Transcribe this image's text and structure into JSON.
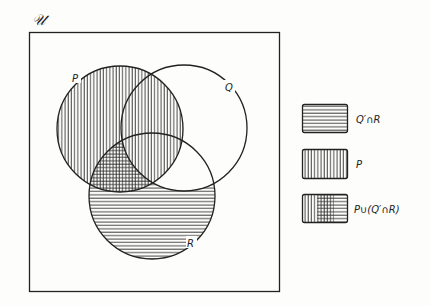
{
  "diagram": {
    "universe_label": "𝒰",
    "sets": [
      {
        "name": "P",
        "label": "P",
        "cx": 120,
        "cy": 129,
        "r": 63
      },
      {
        "name": "Q",
        "label": "Q",
        "cx": 184,
        "cy": 128,
        "r": 63
      },
      {
        "name": "R",
        "label": "R",
        "cx": 152,
        "cy": 196,
        "r": 63
      }
    ],
    "shading": {
      "P": "vertical lines",
      "Q_prime_and_R": "horizontal lines",
      "overlap": "cross-hatch"
    },
    "legend": [
      {
        "pattern": "horizontal",
        "label": "Q′∩R"
      },
      {
        "pattern": "vertical",
        "label": "P"
      },
      {
        "pattern": "combined",
        "label": "P∪(Q′∩R)"
      }
    ],
    "colors": {
      "ink": "#222222",
      "background": "#fdfdfb"
    }
  }
}
